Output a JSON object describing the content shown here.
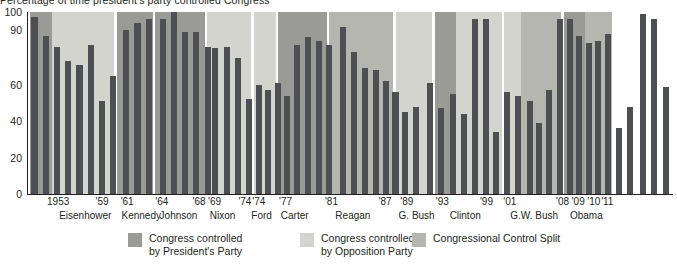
{
  "chart_data": {
    "type": "bar",
    "title": "Percentage of time president's party controlled Congress",
    "xlabel": "",
    "ylabel": "",
    "ylim": [
      0,
      100
    ],
    "grid": false,
    "legend_position": "bottom",
    "y_ticks": [
      "100",
      "90",
      "60",
      "40",
      "20",
      "0"
    ],
    "y_tick_values": [
      100,
      90,
      60,
      40,
      20,
      0
    ],
    "colors": {
      "bar": "#4d4f53",
      "president_party": "#9a9a97",
      "opposition_party": "#d4d4cf",
      "control_split": "#b6b6b1",
      "axis": "#231f20",
      "background": "#ffffff"
    },
    "x_year_labels": [
      {
        "label": "1953",
        "x": 22
      },
      {
        "label": "'59",
        "x": 78
      },
      {
        "label": "'61",
        "x": 107
      },
      {
        "label": "'64",
        "x": 147
      },
      {
        "label": "'68",
        "x": 190
      },
      {
        "label": "'69",
        "x": 208
      },
      {
        "label": "'74",
        "x": 243
      },
      {
        "label": "'74",
        "x": 259
      },
      {
        "label": "'77",
        "x": 290
      },
      {
        "label": "'81",
        "x": 343
      },
      {
        "label": "'87",
        "x": 405
      },
      {
        "label": "'89",
        "x": 430
      },
      {
        "label": "'93",
        "x": 471
      },
      {
        "label": "'99",
        "x": 522
      },
      {
        "label": "'01",
        "x": 549
      },
      {
        "label": "'08",
        "x": 610
      },
      {
        "label": "'09",
        "x": 628
      },
      {
        "label": "'10",
        "x": 646
      },
      {
        "label": "'11",
        "x": 662
      }
    ],
    "x_president_labels": [
      {
        "label": "Eisenhower",
        "x": 36
      },
      {
        "label": "Kennedy",
        "x": 108
      },
      {
        "label": "Johnson",
        "x": 152
      },
      {
        "label": "Nixon",
        "x": 210
      },
      {
        "label": "Ford",
        "x": 258
      },
      {
        "label": "Carter",
        "x": 292
      },
      {
        "label": "Reagan",
        "x": 355
      },
      {
        "label": "G. Bush",
        "x": 428
      },
      {
        "label": "Clinton",
        "x": 487
      },
      {
        "label": "G.W. Bush",
        "x": 557
      },
      {
        "label": "Obama",
        "x": 626
      }
    ],
    "bands": [
      {
        "president": "Eisenhower",
        "x": 2,
        "w": 26,
        "segments": [
          {
            "type": "president_party",
            "from": 0,
            "to": 100
          }
        ]
      },
      {
        "president": "Eisenhower",
        "x": 28,
        "w": 71,
        "segments": [
          {
            "type": "opposition_party",
            "from": 0,
            "to": 100
          }
        ]
      },
      {
        "president": "Kennedy",
        "x": 103,
        "w": 41,
        "segments": [
          {
            "type": "president_party",
            "from": 0,
            "to": 100
          }
        ]
      },
      {
        "president": "Johnson",
        "x": 147,
        "w": 57,
        "segments": [
          {
            "type": "president_party",
            "from": 0,
            "to": 100
          }
        ]
      },
      {
        "president": "Nixon",
        "x": 207,
        "w": 51,
        "segments": [
          {
            "type": "opposition_party",
            "from": 0,
            "to": 100
          }
        ]
      },
      {
        "president": "Ford",
        "x": 261,
        "w": 25,
        "segments": [
          {
            "type": "opposition_party",
            "from": 0,
            "to": 100
          }
        ]
      },
      {
        "president": "Carter",
        "x": 289,
        "w": 56,
        "segments": [
          {
            "type": "president_party",
            "from": 0,
            "to": 100
          }
        ]
      },
      {
        "president": "Reagan",
        "x": 348,
        "w": 74,
        "segments": [
          {
            "type": "control_split",
            "from": 0,
            "to": 100
          }
        ]
      },
      {
        "president": "G. Bush",
        "x": 425,
        "w": 42,
        "segments": [
          {
            "type": "opposition_party",
            "from": 0,
            "to": 100
          }
        ]
      },
      {
        "president": "Clinton",
        "x": 470,
        "w": 24,
        "segments": [
          {
            "type": "president_party",
            "from": 0,
            "to": 100
          }
        ]
      },
      {
        "president": "Clinton",
        "x": 494,
        "w": 53,
        "segments": [
          {
            "type": "opposition_party",
            "from": 0,
            "to": 100
          }
        ]
      },
      {
        "president": "G.W. Bush",
        "x": 550,
        "w": 19,
        "segments": [
          {
            "type": "opposition_party",
            "from": 0,
            "to": 100
          }
        ]
      },
      {
        "president": "G.W. Bush",
        "x": 569,
        "w": 47,
        "segments": [
          {
            "type": "control_split",
            "from": 0,
            "to": 100
          }
        ]
      },
      {
        "president": "Obama",
        "x": 619,
        "w": 24,
        "segments": [
          {
            "type": "president_party",
            "from": 0,
            "to": 100
          }
        ]
      },
      {
        "president": "Obama",
        "x": 643,
        "w": 32,
        "segments": [
          {
            "type": "control_split",
            "from": 0,
            "to": 100
          }
        ]
      }
    ],
    "bars": [
      {
        "president": "Eisenhower",
        "x": 4,
        "value": 97
      },
      {
        "president": "Eisenhower",
        "x": 17,
        "value": 87
      },
      {
        "president": "Eisenhower",
        "x": 30,
        "value": 81
      },
      {
        "president": "Eisenhower",
        "x": 43,
        "value": 73
      },
      {
        "president": "Eisenhower",
        "x": 56,
        "value": 71
      },
      {
        "president": "Eisenhower",
        "x": 69,
        "value": 82
      },
      {
        "president": "Eisenhower",
        "x": 82,
        "value": 51
      },
      {
        "president": "Eisenhower",
        "x": 95,
        "value": 65
      },
      {
        "president": "Kennedy",
        "x": 110,
        "value": 90
      },
      {
        "president": "Kennedy",
        "x": 123,
        "value": 94
      },
      {
        "president": "Kennedy",
        "x": 136,
        "value": 96
      },
      {
        "president": "Johnson",
        "x": 152,
        "value": 96
      },
      {
        "president": "Johnson",
        "x": 165,
        "value": 103
      },
      {
        "president": "Johnson",
        "x": 178,
        "value": 89
      },
      {
        "president": "Johnson",
        "x": 191,
        "value": 89
      },
      {
        "president": "Johnson",
        "x": 204,
        "value": 81
      },
      {
        "president": "Nixon",
        "x": 213,
        "value": 80
      },
      {
        "president": "Nixon",
        "x": 226,
        "value": 81
      },
      {
        "president": "Nixon",
        "x": 239,
        "value": 75
      },
      {
        "president": "Nixon",
        "x": 252,
        "value": 52
      },
      {
        "president": "Nixon",
        "x": 263,
        "value": 60
      },
      {
        "president": "Ford",
        "x": 274,
        "value": 57
      },
      {
        "president": "Ford",
        "x": 285,
        "value": 61
      },
      {
        "president": "Ford",
        "x": 296,
        "value": 54
      },
      {
        "president": "Carter",
        "x": 307,
        "value": 82
      },
      {
        "president": "Carter",
        "x": 320,
        "value": 86
      },
      {
        "president": "Carter",
        "x": 333,
        "value": 84
      },
      {
        "president": "Carter",
        "x": 344,
        "value": 82
      },
      {
        "president": "Reagan",
        "x": 360,
        "value": 92
      },
      {
        "president": "Reagan",
        "x": 373,
        "value": 78
      },
      {
        "president": "Reagan",
        "x": 386,
        "value": 69
      },
      {
        "president": "Reagan",
        "x": 399,
        "value": 68
      },
      {
        "president": "Reagan",
        "x": 410,
        "value": 62
      },
      {
        "president": "Reagan",
        "x": 421,
        "value": 56
      },
      {
        "president": "G. Bush",
        "x": 432,
        "value": 45
      },
      {
        "president": "G. Bush",
        "x": 445,
        "value": 48
      },
      {
        "president": "G. Bush",
        "x": 461,
        "value": 61
      },
      {
        "president": "G. Bush",
        "x": 474,
        "value": 47
      },
      {
        "president": "Clinton",
        "x": 487,
        "value": 55
      },
      {
        "president": "Clinton",
        "x": 500,
        "value": 44
      },
      {
        "president": "Clinton",
        "x": 513,
        "value": 96
      },
      {
        "president": "Clinton",
        "x": 526,
        "value": 96
      },
      {
        "president": "Clinton",
        "x": 537,
        "value": 34
      },
      {
        "president": "Clinton",
        "x": 550,
        "value": 56
      },
      {
        "president": "Clinton",
        "x": 563,
        "value": 54
      },
      {
        "president": "Clinton",
        "x": 576,
        "value": 51
      },
      {
        "president": "Clinton",
        "x": 587,
        "value": 39
      },
      {
        "president": "G.W. Bush",
        "x": 598,
        "value": 57
      },
      {
        "president": "G.W. Bush",
        "x": 611,
        "value": 96
      },
      {
        "president": "G.W. Bush",
        "x": 622,
        "value": 96
      },
      {
        "president": "G.W. Bush",
        "x": 633,
        "value": 87
      },
      {
        "president": "G.W. Bush",
        "x": 644,
        "value": 83
      },
      {
        "president": "G.W. Bush",
        "x": 655,
        "value": 84
      },
      {
        "president": "G.W. Bush",
        "x": 666,
        "value": 88
      },
      {
        "president": "G.W. Bush",
        "x": 679,
        "value": 36
      },
      {
        "president": "G.W. Bush",
        "x": 692,
        "value": 48
      },
      {
        "president": "Obama",
        "x": 707,
        "value": 99
      },
      {
        "president": "Obama",
        "x": 720,
        "value": 96
      },
      {
        "president": "Obama",
        "x": 733,
        "value": 59
      }
    ]
  },
  "legend": [
    {
      "key": "president_party",
      "label": "Congress controlled\nby President's Party",
      "color": "#9a9a97",
      "x": 128
    },
    {
      "key": "opposition_party",
      "label": "Congress controlled\nby Opposition Party",
      "color": "#d4d4cf",
      "x": 300
    },
    {
      "key": "control_split",
      "label": "Congressional Control Split",
      "color": "#b6b6b1",
      "x": 412
    }
  ]
}
